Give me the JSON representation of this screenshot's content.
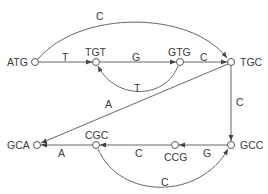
{
  "diagram": {
    "type": "de Bruijn graph",
    "colors": {
      "stroke": "#555555",
      "text": "#3a3a3a",
      "node_fill": "#ffffff"
    },
    "nodes": [
      {
        "id": "ATG",
        "label": "ATG",
        "x": 35,
        "y": 62
      },
      {
        "id": "TGT",
        "label": "TGT",
        "x": 96,
        "y": 62
      },
      {
        "id": "GTG",
        "label": "GTG",
        "x": 180,
        "y": 62
      },
      {
        "id": "TGC",
        "label": "TGC",
        "x": 231,
        "y": 62
      },
      {
        "id": "GCA",
        "label": "GCA",
        "x": 37,
        "y": 145
      },
      {
        "id": "CGC",
        "label": "CGC",
        "x": 96,
        "y": 145
      },
      {
        "id": "CCG",
        "label": "CCG",
        "x": 175,
        "y": 145
      },
      {
        "id": "GCC",
        "label": "GCC",
        "x": 231,
        "y": 145
      }
    ],
    "edges": [
      {
        "from": "ATG",
        "to": "TGC",
        "label": "C"
      },
      {
        "from": "ATG",
        "to": "TGT",
        "label": "T"
      },
      {
        "from": "TGT",
        "to": "GTG",
        "label": "G"
      },
      {
        "from": "GTG",
        "to": "TGT",
        "label": "T"
      },
      {
        "from": "GTG",
        "to": "TGC",
        "label": "C"
      },
      {
        "from": "TGC",
        "to": "GCA",
        "label": "A"
      },
      {
        "from": "TGC",
        "to": "GCC",
        "label": "C"
      },
      {
        "from": "GCC",
        "to": "CCG",
        "label": "G"
      },
      {
        "from": "CCG",
        "to": "CGC",
        "label": "C"
      },
      {
        "from": "CGC",
        "to": "GCA",
        "label": "A"
      },
      {
        "from": "CGC",
        "to": "GCC",
        "label": "C"
      }
    ]
  }
}
